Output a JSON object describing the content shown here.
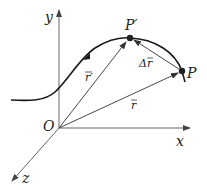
{
  "diagram": {
    "type": "displacement-vector-diagram",
    "axes": {
      "x_label": "x",
      "y_label": "y",
      "z_label": "z",
      "origin_label": "O"
    },
    "points": {
      "p_label": "P",
      "p_prime_label": "P′"
    },
    "vectors": {
      "r_label": "r",
      "r_prime_label": "r′",
      "delta_r_label": "Δr"
    },
    "colors": {
      "curve": "#1a1a1a",
      "axis": "#555555",
      "vector": "#333333",
      "point": "#222222"
    }
  }
}
